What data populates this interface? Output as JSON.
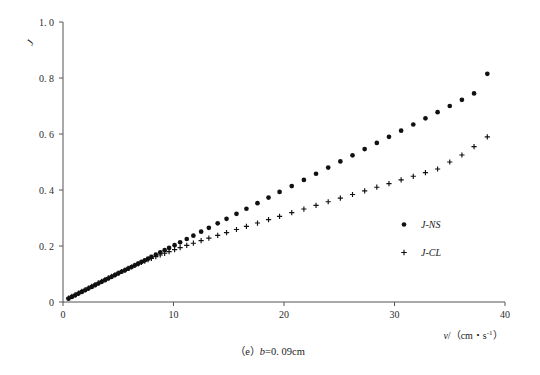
{
  "figure": {
    "caption": "（e）b=0.09cm",
    "caption_prefix": "（e）",
    "caption_var": "b",
    "caption_rest": "=0. 09cm"
  },
  "axes": {
    "y_title": "J",
    "x_title_main": "v/（cm・s",
    "x_title_sup": "-1",
    "x_title_tail": "）",
    "x_ticks": [
      "0",
      "10",
      "20",
      "30",
      "40"
    ],
    "y_ticks": [
      "0",
      "0. 2",
      "0. 4",
      "0. 6",
      "0. 8",
      "1. 0"
    ]
  },
  "legend": {
    "position": "inside-right",
    "entries": [
      {
        "label": "J-NS",
        "marker": "dot-marker"
      },
      {
        "label": "J-CL",
        "marker": "plus-marker"
      }
    ]
  },
  "chart_data": {
    "type": "scatter",
    "title": "",
    "subtitle": "",
    "xlabel": "v/(cm·s^-1)",
    "ylabel": "J",
    "xlim": [
      0,
      40
    ],
    "ylim": [
      0,
      1.0
    ],
    "xticks": [
      0,
      10,
      20,
      30,
      40
    ],
    "yticks": [
      0,
      0.2,
      0.4,
      0.6,
      0.8,
      1.0
    ],
    "grid": false,
    "legend_position": "center right",
    "annotations": [
      "(e) b=0.09cm"
    ],
    "series": [
      {
        "name": "J-NS",
        "marker": "filled-circle",
        "color": "#111111",
        "x": [
          0.5,
          0.8,
          1.1,
          1.4,
          1.7,
          2.0,
          2.3,
          2.6,
          2.9,
          3.2,
          3.5,
          3.8,
          4.1,
          4.4,
          4.7,
          5.0,
          5.3,
          5.6,
          5.9,
          6.2,
          6.5,
          6.8,
          7.1,
          7.4,
          7.7,
          8.0,
          8.4,
          8.8,
          9.2,
          9.6,
          10.1,
          10.6,
          11.2,
          11.8,
          12.5,
          13.2,
          14.0,
          14.8,
          15.7,
          16.6,
          17.6,
          18.6,
          19.6,
          20.7,
          21.8,
          22.9,
          24.0,
          25.1,
          26.2,
          27.3,
          28.4,
          29.5,
          30.6,
          31.7,
          32.8,
          33.9,
          35.0,
          36.1,
          37.2,
          38.4
        ],
        "y": [
          0.012,
          0.018,
          0.024,
          0.03,
          0.036,
          0.042,
          0.048,
          0.054,
          0.06,
          0.066,
          0.072,
          0.078,
          0.084,
          0.09,
          0.096,
          0.102,
          0.108,
          0.113,
          0.119,
          0.125,
          0.131,
          0.137,
          0.143,
          0.149,
          0.155,
          0.161,
          0.169,
          0.177,
          0.185,
          0.193,
          0.203,
          0.213,
          0.225,
          0.237,
          0.251,
          0.265,
          0.281,
          0.297,
          0.315,
          0.333,
          0.353,
          0.373,
          0.393,
          0.414,
          0.436,
          0.458,
          0.48,
          0.502,
          0.524,
          0.546,
          0.568,
          0.59,
          0.612,
          0.634,
          0.656,
          0.678,
          0.7,
          0.722,
          0.745,
          0.815
        ]
      },
      {
        "name": "J-CL",
        "marker": "plus",
        "color": "#111111",
        "x": [
          0.5,
          0.8,
          1.1,
          1.4,
          1.7,
          2.0,
          2.3,
          2.6,
          2.9,
          3.2,
          3.5,
          3.8,
          4.1,
          4.4,
          4.7,
          5.0,
          5.3,
          5.6,
          5.9,
          6.2,
          6.5,
          6.8,
          7.1,
          7.4,
          7.7,
          8.0,
          8.4,
          8.8,
          9.2,
          9.6,
          10.1,
          10.6,
          11.2,
          11.8,
          12.5,
          13.2,
          14.0,
          14.8,
          15.7,
          16.6,
          17.6,
          18.6,
          19.6,
          20.7,
          21.8,
          22.9,
          24.0,
          25.1,
          26.2,
          27.3,
          28.4,
          29.5,
          30.6,
          31.7,
          32.8,
          33.9,
          35.0,
          36.1,
          37.2,
          38.4
        ],
        "y": [
          0.014,
          0.02,
          0.026,
          0.032,
          0.038,
          0.044,
          0.05,
          0.056,
          0.062,
          0.068,
          0.074,
          0.08,
          0.086,
          0.092,
          0.097,
          0.103,
          0.109,
          0.114,
          0.12,
          0.125,
          0.131,
          0.136,
          0.141,
          0.146,
          0.151,
          0.156,
          0.162,
          0.168,
          0.174,
          0.18,
          0.187,
          0.194,
          0.202,
          0.21,
          0.219,
          0.228,
          0.238,
          0.248,
          0.259,
          0.27,
          0.282,
          0.294,
          0.306,
          0.319,
          0.332,
          0.345,
          0.358,
          0.371,
          0.384,
          0.397,
          0.41,
          0.423,
          0.436,
          0.449,
          0.462,
          0.475,
          0.5,
          0.525,
          0.555,
          0.59
        ]
      }
    ]
  }
}
